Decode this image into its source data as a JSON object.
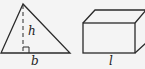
{
  "diagram": {
    "triangle": {
      "height_label": "h",
      "base_label": "b",
      "apex": [
        23,
        4
      ],
      "base_left": [
        1,
        53
      ],
      "base_right": [
        70,
        53
      ]
    },
    "box": {
      "length_label": "l"
    },
    "colors": {
      "stroke": "#2a2a2a",
      "background": "#f4f4f4"
    }
  }
}
